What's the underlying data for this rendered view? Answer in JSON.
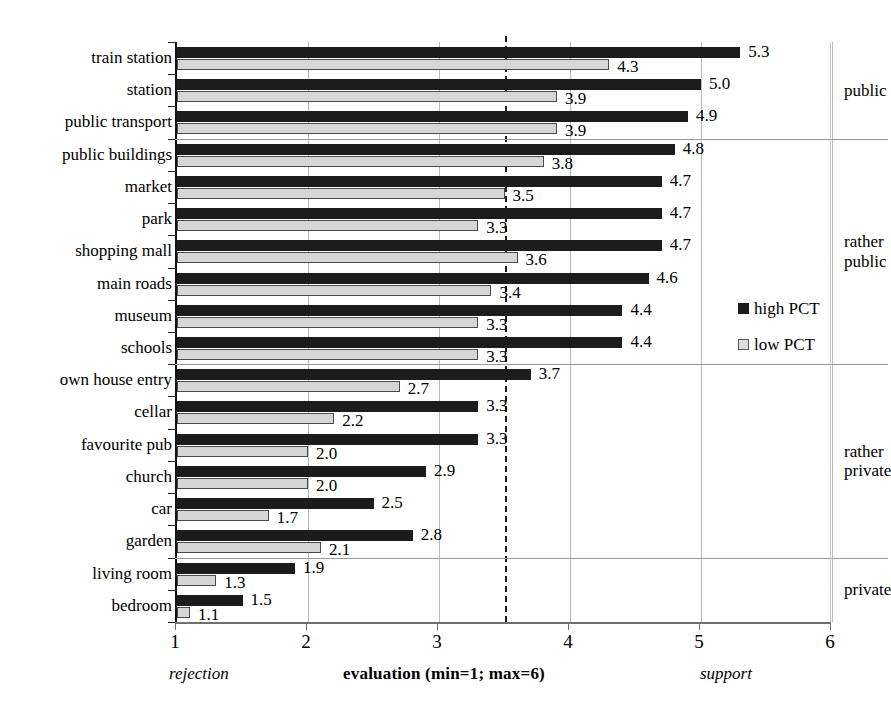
{
  "chart_data": {
    "type": "bar",
    "orientation": "horizontal",
    "title": "",
    "xlabel": "evaluation (min=1; max=6)",
    "ylabel": "",
    "xlim": [
      1,
      6
    ],
    "xticks": [
      "1",
      "2",
      "3",
      "4",
      "5",
      "6"
    ],
    "grid": true,
    "legend_position": "right",
    "reference_line": 3.5,
    "axis_low_note": "rejection",
    "axis_high_note": "support",
    "categories": [
      "train station",
      "station",
      "public transport",
      "public buildings",
      "market",
      "park",
      "shopping mall",
      "main roads",
      "museum",
      "schools",
      "own house entry",
      "cellar",
      "favourite pub",
      "church",
      "car",
      "garden",
      "living room",
      "bedroom"
    ],
    "series": [
      {
        "name": "high PCT",
        "color": "#1c1c1c",
        "values": [
          5.3,
          5.0,
          4.9,
          4.8,
          4.7,
          4.7,
          4.7,
          4.6,
          4.4,
          4.4,
          3.7,
          3.3,
          3.3,
          2.9,
          2.5,
          2.8,
          1.9,
          1.5
        ]
      },
      {
        "name": "low PCT",
        "color": "#d6d6d6",
        "values": [
          4.3,
          3.9,
          3.9,
          3.8,
          3.5,
          3.3,
          3.6,
          3.4,
          3.3,
          3.3,
          2.7,
          2.2,
          2.0,
          2.0,
          1.7,
          2.1,
          1.3,
          1.1
        ]
      }
    ],
    "group_labels": [
      {
        "label": "public",
        "start": 0,
        "end": 2
      },
      {
        "label": "rather\npublic",
        "start": 3,
        "end": 9
      },
      {
        "label": "rather\nprivate",
        "start": 10,
        "end": 15
      },
      {
        "label": "private",
        "start": 16,
        "end": 17
      }
    ],
    "group_label_lines": [
      [
        "public"
      ],
      [
        "rather",
        "public"
      ],
      [
        "rather",
        "private"
      ],
      [
        "private"
      ]
    ]
  },
  "legend": {
    "items": [
      {
        "label": "high PCT",
        "swatch": "filled-black-square"
      },
      {
        "label": "low PCT",
        "swatch": "outlined-gray-square"
      }
    ]
  }
}
